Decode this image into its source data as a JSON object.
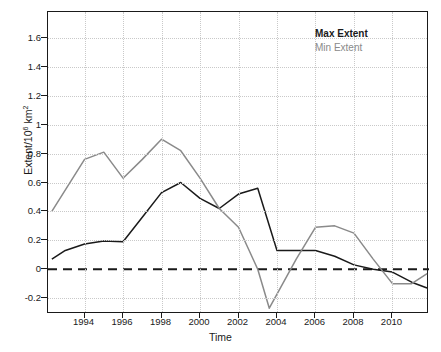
{
  "chart_data": {
    "type": "line",
    "title": "",
    "xlabel": "Time",
    "ylabel": "Extent/10^6 km^2",
    "xlim": [
      1992.1,
      2511.9
    ],
    "ylim": [
      -0.31,
      1.78
    ],
    "grid": true,
    "legend_position": "top-right",
    "x_ticks": [
      1994,
      1996,
      1998,
      2000,
      2002,
      2004,
      2006,
      2008,
      2010
    ],
    "y_ticks": [
      -0.2,
      0,
      0.2,
      0.4,
      0.6,
      0.8,
      1,
      1.2,
      1.4,
      1.6
    ],
    "zero_reference_line": 0,
    "series": [
      {
        "name": "Max Extent",
        "color": "#1a1a1a",
        "x": [
          1992.3,
          1993,
          1994,
          1995,
          1996,
          1997,
          1998,
          1999,
          2000,
          2001,
          2002,
          2003,
          2004,
          2005,
          2006,
          2007,
          2008,
          2009,
          2010,
          2011,
          2011.8
        ],
        "y": [
          0.07,
          0.13,
          0.175,
          0.195,
          0.19,
          0.36,
          0.53,
          0.6,
          0.49,
          0.42,
          0.52,
          0.56,
          0.13,
          0.13,
          0.13,
          0.09,
          0.03,
          0.0,
          -0.02,
          -0.09,
          -0.13
        ]
      },
      {
        "name": "Min Extent",
        "color": "#8a8a8a",
        "x": [
          1992.3,
          1994,
          1995,
          1996,
          1997,
          1998,
          1999,
          2000,
          2001,
          2002,
          2003,
          2003.6,
          2005,
          2006,
          2007,
          2008,
          2009,
          2010,
          2011,
          2011.8
        ],
        "y": [
          0.4,
          0.76,
          0.81,
          0.63,
          0.76,
          0.9,
          0.82,
          0.63,
          0.42,
          0.29,
          0.0,
          -0.27,
          0.07,
          0.29,
          0.3,
          0.25,
          0.07,
          -0.1,
          -0.1,
          -0.03
        ]
      }
    ]
  },
  "axes": {
    "y_tick_labels": [
      "1.6",
      "1.4",
      "1.2",
      "1",
      "0.8",
      "0.6",
      "0.4",
      "0.2",
      "0",
      "-0.2"
    ],
    "x_tick_labels": [
      "1994",
      "1996",
      "1998",
      "2000",
      "2002",
      "2004",
      "2006",
      "2008",
      "2010"
    ],
    "x_axis_title": "Time",
    "y_axis_title_prefix": "Extent/10",
    "y_axis_title_exponent": "6",
    "y_axis_title_suffix": " km",
    "y_axis_unit_exponent": "2"
  },
  "legend": {
    "max_label": "Max Extent",
    "min_label": "Min Extent",
    "max_color": "#1a1a1a",
    "min_color": "#8a8a8a"
  }
}
